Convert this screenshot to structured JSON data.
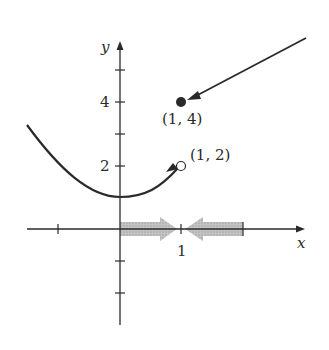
{
  "figure": {
    "axes": {
      "x_label": "x",
      "y_label": "y",
      "x_tick_label": "1",
      "y_tick_labels": {
        "two": "2",
        "four": "4"
      }
    },
    "points": {
      "filled": {
        "label": "(1, 4)",
        "x": 1,
        "y": 4,
        "style": "filled"
      },
      "open": {
        "label": "(1, 2)",
        "x": 1,
        "y": 2,
        "style": "open"
      }
    },
    "curve": {
      "description": "y = x^2 + 1 for x < 1, approaching open point (1, 2)"
    },
    "arrows": {
      "incoming_line": "approaches filled point (1, 4) from upper right",
      "x_axis_left": "shaded arrow from 0 pointing right toward x = 1",
      "x_axis_right": "shaded arrow from 2 pointing left toward x = 1"
    },
    "colors": {
      "ink": "#2a2a2a",
      "shaded_arrow": "#b8b8b8",
      "background": "#ffffff"
    }
  }
}
